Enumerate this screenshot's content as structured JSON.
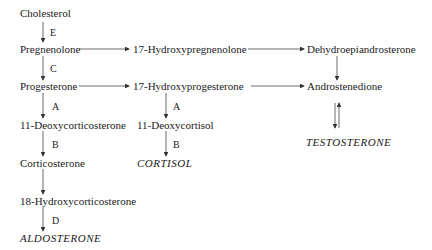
{
  "diagram": {
    "nodes": {
      "cholesterol": "Cholesterol",
      "pregnenolone": "Pregnenolone",
      "hydroxypregnenolone": "17-Hydroxypregnenolone",
      "dhea": "Dehydroepiandrosterone",
      "progesterone": "Progesterone",
      "hydroxyprogesterone": "17-Hydroxyprogesterone",
      "androstenedione": "Androstenedione",
      "deoxycorticosterone": "11-Deoxycorticosterone",
      "deoxycortisol": "11-Deoxycortisol",
      "testosterone": "TESTOSTERONE",
      "corticosterone": "Corticosterone",
      "cortisol": "CORTISOL",
      "hydroxycorticosterone": "18-Hydroxycorticosterone",
      "aldosterone": "ALDOSTERONE"
    },
    "enzyme_labels": {
      "chol_preg": "E",
      "preg_prog": "C",
      "prog_doc": "A",
      "doc_cort": "B",
      "hcort_aldo": "D",
      "ohp_dcortisol": "A",
      "dcortisol_cortisol": "B"
    }
  }
}
